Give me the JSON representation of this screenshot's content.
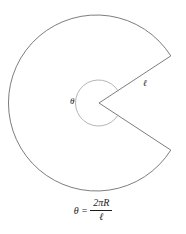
{
  "figure": {
    "type": "geometry-diagram",
    "colors": {
      "background": "#ffffff",
      "outline": "#6e6e70",
      "inner_arc": "#9c9c9e",
      "text": "#1c1c1c"
    },
    "geometry": {
      "center_x": 99,
      "center_y": 103,
      "outer_radius": 88,
      "inner_arc_radius": 23,
      "wedge_half_angle_deg": 33,
      "wedge_upper_vertex_x": 170,
      "wedge_upper_vertex_y": 56,
      "wedge_lower_vertex_x": 170,
      "wedge_lower_vertex_y": 155
    }
  },
  "labels": {
    "theta": "θ",
    "ell": "ℓ"
  },
  "formula": {
    "lhs": "θ",
    "equals": "=",
    "numerator": "2πR",
    "denominator": "ℓ",
    "plain": "θ = 2πR / ℓ"
  }
}
